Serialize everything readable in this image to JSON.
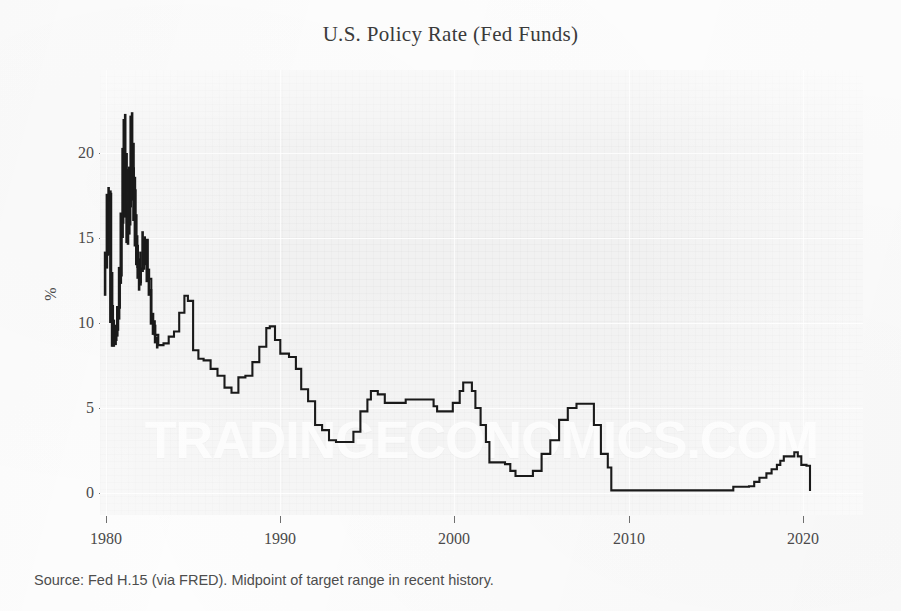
{
  "chart_title": "U.S. Policy Rate (Fed Funds)",
  "caption": "Source: Fed H.15 (via FRED). Midpoint of target range in recent history.",
  "watermark": "TRADINGECONOMICS.COM",
  "axes": {
    "y_label": "%",
    "y_ticks": [
      "0",
      "5",
      "10",
      "15",
      "20"
    ],
    "x_ticks": [
      "1980",
      "1990",
      "2000",
      "2010",
      "2020"
    ]
  },
  "colors": {
    "series_line": "#1a1a1a",
    "plot_background": "#f1f1f1",
    "gridline": "#ffffff",
    "text": "#3f3f3f",
    "watermark": "#ffffff"
  },
  "chart_data": {
    "type": "line",
    "title": "U.S. Policy Rate (Fed Funds)",
    "subtitle": "",
    "xlabel": "",
    "ylabel": "%",
    "xlim": [
      1979.0,
      1924.0
    ],
    "x_axis_range": [
      1979.0,
      2024.0
    ],
    "ylim": [
      -1.2,
      24.0
    ],
    "grid": true,
    "legend": null,
    "x_tick_values": [
      1980,
      1990,
      2000,
      2010,
      2020
    ],
    "y_tick_values": [
      0,
      5,
      10,
      15,
      20
    ],
    "series": [
      {
        "name": "Federal Funds Rate (effective / target midpoint)",
        "units": "percent",
        "x": [
          1979.9,
          1980.0,
          1980.1,
          1980.2,
          1980.3,
          1980.4,
          1980.5,
          1980.6,
          1980.7,
          1980.8,
          1980.9,
          1981.0,
          1981.1,
          1981.2,
          1981.3,
          1981.4,
          1981.5,
          1981.6,
          1981.7,
          1981.8,
          1981.9,
          1982.0,
          1982.2,
          1982.4,
          1982.6,
          1982.8,
          1983.0,
          1983.3,
          1983.6,
          1983.9,
          1984.2,
          1984.5,
          1984.7,
          1985.0,
          1985.3,
          1985.6,
          1986.0,
          1986.4,
          1986.8,
          1987.2,
          1987.6,
          1988.0,
          1988.4,
          1988.8,
          1989.2,
          1989.4,
          1989.7,
          1990.0,
          1990.5,
          1990.9,
          1991.2,
          1991.6,
          1992.0,
          1992.4,
          1992.8,
          1993.2,
          1993.8,
          1994.2,
          1994.6,
          1995.0,
          1995.2,
          1995.6,
          1996.0,
          1996.5,
          1997.2,
          1997.8,
          1998.6,
          1998.8,
          1999.0,
          1999.5,
          1999.9,
          2000.3,
          2000.5,
          2001.0,
          2001.2,
          2001.5,
          2001.8,
          2002.0,
          2002.9,
          2003.2,
          2003.5,
          2004.0,
          2004.5,
          2005.0,
          2005.5,
          2006.0,
          2006.5,
          2007.0,
          2007.6,
          2008.0,
          2008.4,
          2008.8,
          2009.0,
          2010.0,
          2012.0,
          2014.0,
          2015.8,
          2016.0,
          2016.9,
          2017.2,
          2017.5,
          2017.9,
          2018.2,
          2018.5,
          2018.7,
          2018.9,
          2019.5,
          2019.7,
          2019.9,
          2020.2,
          2020.4
        ],
        "y": [
          13.8,
          14.0,
          17.2,
          17.6,
          11.0,
          9.5,
          9.0,
          9.6,
          10.9,
          12.8,
          15.9,
          19.1,
          19.0,
          15.9,
          15.8,
          18.5,
          19.1,
          17.8,
          15.1,
          13.3,
          12.4,
          13.2,
          14.9,
          12.6,
          10.1,
          9.3,
          8.7,
          8.8,
          9.2,
          9.5,
          10.6,
          11.6,
          11.3,
          8.4,
          7.9,
          7.8,
          7.3,
          6.9,
          6.2,
          5.9,
          6.8,
          6.9,
          7.7,
          8.6,
          9.7,
          9.8,
          9.0,
          8.2,
          8.0,
          7.3,
          6.1,
          5.4,
          4.0,
          3.7,
          3.1,
          3.0,
          3.0,
          3.6,
          4.8,
          5.5,
          6.0,
          5.8,
          5.3,
          5.3,
          5.5,
          5.5,
          5.5,
          5.1,
          4.8,
          4.8,
          5.3,
          6.0,
          6.5,
          6.0,
          5.0,
          4.0,
          3.0,
          1.8,
          1.7,
          1.3,
          1.0,
          1.0,
          1.3,
          2.3,
          3.1,
          4.3,
          5.0,
          5.25,
          5.25,
          4.0,
          2.3,
          1.5,
          0.15,
          0.15,
          0.15,
          0.15,
          0.15,
          0.37,
          0.4,
          0.65,
          0.9,
          1.15,
          1.4,
          1.65,
          1.9,
          2.15,
          2.4,
          2.15,
          1.65,
          1.6,
          0.12
        ]
      }
    ],
    "annotations": [
      {
        "text": "1981 peak near 22%",
        "x": 1981.2,
        "y": 22.0
      },
      {
        "text": "ZIRP 2009-2015 at ~0.125%",
        "x": 2012.0,
        "y": 0.125
      },
      {
        "text": "2020 cut to ~0.125%",
        "x": 2020.3,
        "y": 0.125
      }
    ],
    "notable_values": {
      "max": 22.0,
      "max_year": 1981,
      "min": 0.1,
      "min_year": 2020,
      "zirp_level": 0.125,
      "zirp_start": 2009,
      "zirp_end": 2015,
      "pre_2008_plateau": 5.25,
      "year_2000_peak": 6.5,
      "year_2019_peak": 2.4
    }
  }
}
